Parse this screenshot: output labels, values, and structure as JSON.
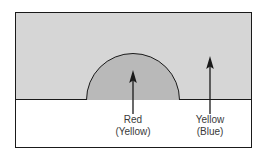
{
  "figure": {
    "type": "diagram",
    "colors": {
      "upper_region_fill": "#d6d6d6",
      "lower_region_fill": "#ffffff",
      "dome_fill": "#b9b9b9",
      "outline": "#1a1a1a",
      "text": "#3a3a3a"
    },
    "regions": [
      {
        "name": "upper-region",
        "fill": "#d6d6d6"
      },
      {
        "name": "lower-region",
        "fill": "#ffffff"
      },
      {
        "name": "dome",
        "fill": "#b9b9b9"
      }
    ],
    "arrows": [
      {
        "name": "dome-arrow",
        "points_to": "dome",
        "direction": "up"
      },
      {
        "name": "upper-region-arrow",
        "points_to": "upper-region",
        "direction": "up"
      }
    ],
    "labels": [
      {
        "name": "dome-label",
        "line1": "Red",
        "line2": "(Yellow)"
      },
      {
        "name": "upper-region-label",
        "line1": "Yellow",
        "line2": "(Blue)"
      }
    ]
  }
}
